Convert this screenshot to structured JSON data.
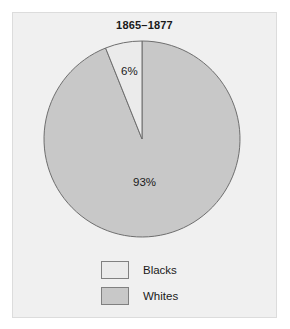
{
  "figure": {
    "title": "1865–1877",
    "background_color": "#f0f0f0",
    "border_color": "#dcdcdc",
    "page_background": "#ffffff"
  },
  "chart_data": {
    "type": "pie",
    "title": "1865–1877",
    "xlabel": "",
    "ylabel": "",
    "categories": [
      "Blacks",
      "Whites"
    ],
    "values": [
      6,
      93
    ],
    "value_labels": [
      "6%",
      "93%"
    ],
    "units": "percent",
    "start_angle_deg": 90,
    "direction": "counterclockwise",
    "slice_colors": [
      "#ebebeb",
      "#c8c8c8"
    ],
    "slice_outline_color": "#6e6e6e",
    "legend_position": "bottom",
    "grid": false,
    "slices": [
      {
        "name": "Blacks",
        "value": 6,
        "label": "6%",
        "color": "#ebebeb"
      },
      {
        "name": "Whites",
        "value": 93,
        "label": "93%",
        "color": "#c8c8c8"
      }
    ]
  },
  "legend": {
    "entries": [
      {
        "label": "Blacks",
        "color": "#ebebeb"
      },
      {
        "label": "Whites",
        "color": "#c8c8c8"
      }
    ]
  }
}
